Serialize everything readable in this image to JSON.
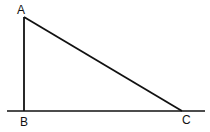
{
  "diagram": {
    "type": "right-triangle",
    "stroke_color": "#111111",
    "background": "#ffffff",
    "vertices": {
      "A": {
        "label": "A",
        "x": 24,
        "y": 17
      },
      "B": {
        "label": "B",
        "x": 24,
        "y": 111
      },
      "C": {
        "label": "C",
        "x": 182,
        "y": 111
      }
    },
    "baseline": {
      "x1": 7,
      "x2": 205,
      "y": 111
    }
  }
}
